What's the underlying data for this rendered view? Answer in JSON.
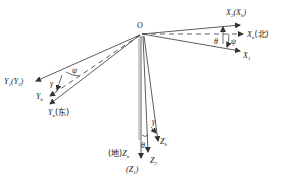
{
  "diagram": {
    "title": "",
    "origin_label": "O",
    "axes": {
      "xn": {
        "main": "X",
        "sub": "n",
        "suffix": "(北)"
      },
      "x2": {
        "main": "X",
        "sub": "2",
        "paren_main": "X",
        "paren_sub": "b"
      },
      "x1": {
        "main": "X",
        "sub": "1"
      },
      "y1": {
        "main": "Y",
        "sub": "1",
        "paren_main": "Y",
        "paren_sub": "2"
      },
      "yb": {
        "main": "Y",
        "sub": "b"
      },
      "yn": {
        "main": "Y",
        "sub": "n",
        "suffix": "(东)"
      },
      "zn": {
        "prefix": "(地)",
        "main": "Z",
        "sub": "n",
        "paren_main": "Z",
        "paren_sub": "1"
      },
      "z2": {
        "main": "Z",
        "sub": "2"
      },
      "zb": {
        "main": "Z",
        "sub": "b"
      }
    },
    "angles": {
      "theta_x": "θ",
      "psi_x": "ψ",
      "psi_y": "ψ",
      "gamma_y": "γ",
      "gamma_z": "γ",
      "theta_z": "θ"
    },
    "colors": {
      "line": "#333333",
      "text": "#222222",
      "background": "#ffffff"
    }
  }
}
